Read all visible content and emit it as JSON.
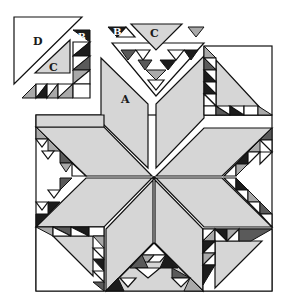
{
  "diagram": {
    "colors": {
      "background": "#ffffff",
      "light": "#d6d6d6",
      "medium": "#a9a9a9",
      "dark_gray": "#5a5a5a",
      "black": "#1c1c1c",
      "outline": "#111111"
    },
    "pieces": [
      {
        "id": "A",
        "label": "A",
        "shape": "diamond"
      },
      {
        "id": "B",
        "label": "B",
        "shape": "small half-square triangle"
      },
      {
        "id": "C",
        "label": "C",
        "shape": "medium triangle"
      },
      {
        "id": "D",
        "label": "D",
        "shape": "large corner triangle"
      }
    ],
    "labels": {
      "a": "A",
      "b_left": "B",
      "b_top": "B",
      "c_left": "C",
      "c_top": "C",
      "d": "D"
    }
  }
}
